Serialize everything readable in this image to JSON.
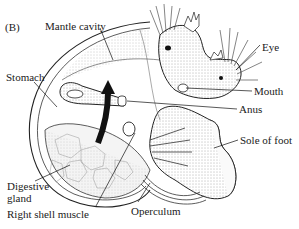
{
  "figure": {
    "panel_label": "(B)",
    "labels": [
      {
        "id": "mantle-cavity",
        "text": "Mantle cavity",
        "x": 45,
        "y": 20
      },
      {
        "id": "eye",
        "text": "Eye",
        "x": 262,
        "y": 41
      },
      {
        "id": "stomach",
        "text": "Stomach",
        "x": 6,
        "y": 71
      },
      {
        "id": "mouth",
        "text": "Mouth",
        "x": 254,
        "y": 85
      },
      {
        "id": "anus",
        "text": "Anus",
        "x": 239,
        "y": 103
      },
      {
        "id": "sole-of-foot",
        "text": "Sole of foot",
        "x": 240,
        "y": 134
      },
      {
        "id": "digestive-gland",
        "text": "Digestive\ngland",
        "x": 7,
        "y": 180
      },
      {
        "id": "right-shell-muscle",
        "text": "Right shell muscle",
        "x": 7,
        "y": 208
      },
      {
        "id": "operculum",
        "text": "Operculum",
        "x": 131,
        "y": 205
      }
    ]
  }
}
